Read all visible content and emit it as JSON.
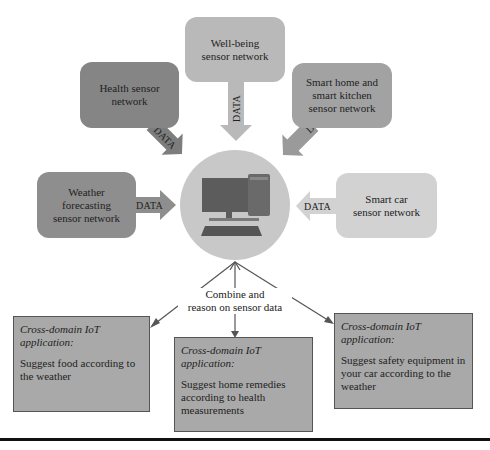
{
  "diagram": {
    "hub": {
      "icon": "desktop-computer-icon",
      "color": "#c8c8c8"
    },
    "sensor_networks": [
      {
        "id": "well-being",
        "label_lines": [
          "Well-being",
          "sensor network"
        ],
        "color": "#b9b9b9",
        "arrow_label": "DATA"
      },
      {
        "id": "health",
        "label_lines": [
          "Health sensor",
          "network"
        ],
        "color": "#858585",
        "arrow_label": "DATA"
      },
      {
        "id": "smart-home",
        "label_lines": [
          "Smart home and",
          "smart kitchen",
          "sensor network"
        ],
        "color": "#a2a2a2",
        "arrow_label": "DATA"
      },
      {
        "id": "weather",
        "label_lines": [
          "Weather",
          "forecasting",
          "sensor network"
        ],
        "color": "#8e8e8e",
        "arrow_label": "DATA"
      },
      {
        "id": "smart-car",
        "label_lines": [
          "Smart car",
          "sensor network"
        ],
        "color": "#d2d2d2",
        "arrow_label": "DATA"
      }
    ],
    "reasoning_label_lines": [
      "Combine and",
      "reason on sensor data"
    ],
    "applications": [
      {
        "title": "Cross-domain IoT application:",
        "description": "Suggest food according to the weather"
      },
      {
        "title": "Cross-domain IoT application:",
        "description": "Suggest home remedies according to health measurements"
      },
      {
        "title": "Cross-domain IoT application:",
        "description": "Suggest safety equipment in your car according to the weather"
      }
    ]
  }
}
